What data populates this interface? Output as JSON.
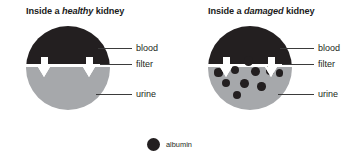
{
  "figure": {
    "background_color": "#ffffff",
    "blood_color": "#231f20",
    "urine_color": "#a6a8ab",
    "filter_color": "#ffffff",
    "arrow_color": "#ffffff",
    "albumin_color": "#231f20",
    "leader_color": "#3b3b3b"
  },
  "panels": [
    {
      "id": "healthy",
      "title_prefix": "Inside a ",
      "title_emphasis": "healthy",
      "title_suffix": " kidney",
      "labels": {
        "blood": "blood",
        "filter": "filter",
        "urine": "urine"
      },
      "arrow_count": 2,
      "albumin_in_urine": 0
    },
    {
      "id": "damaged",
      "title_prefix": "Inside a ",
      "title_emphasis": "damaged",
      "title_suffix": " kidney",
      "labels": {
        "blood": "blood",
        "filter": "filter",
        "urine": "urine"
      },
      "arrow_count": 2,
      "albumin_in_urine": 10
    }
  ],
  "legend": {
    "label": "albumin"
  },
  "chart_data": {
    "type": "diagram",
    "panels": [
      {
        "name": "Inside a healthy kidney",
        "regions": [
          {
            "name": "blood",
            "fraction": 0.45,
            "color": "#231f20"
          },
          {
            "name": "filter",
            "fraction": 0.035,
            "color": "#ffffff"
          },
          {
            "name": "urine",
            "fraction": 0.515,
            "color": "#a6a8ab"
          }
        ],
        "albumin_particles_in_urine": 0,
        "flow_arrows": 2
      },
      {
        "name": "Inside a damaged kidney",
        "regions": [
          {
            "name": "blood",
            "fraction": 0.45,
            "color": "#231f20"
          },
          {
            "name": "filter",
            "fraction": 0.035,
            "color": "#ffffff"
          },
          {
            "name": "urine",
            "fraction": 0.515,
            "color": "#a6a8ab"
          }
        ],
        "albumin_particles_in_urine": 10,
        "flow_arrows": 2
      }
    ],
    "legend_entries": [
      {
        "label": "albumin",
        "marker": "circle",
        "color": "#231f20"
      }
    ]
  },
  "albumin_positions": [
    {
      "x": 40.5,
      "y": 35.0,
      "r": 4.6
    },
    {
      "x": 27.0,
      "y": 44.0,
      "r": 4.4
    },
    {
      "x": 47.5,
      "y": 45.5,
      "r": 4.6
    },
    {
      "x": 62.0,
      "y": 44.5,
      "r": 4.3
    },
    {
      "x": 10.5,
      "y": 46.5,
      "r": 4.1
    },
    {
      "x": 71.5,
      "y": 47.0,
      "r": 3.9
    },
    {
      "x": 18.0,
      "y": 57.0,
      "r": 4.4
    },
    {
      "x": 36.5,
      "y": 57.5,
      "r": 4.4
    },
    {
      "x": 53.5,
      "y": 60.5,
      "r": 4.2
    },
    {
      "x": 29.0,
      "y": 68.5,
      "r": 4.0
    }
  ]
}
